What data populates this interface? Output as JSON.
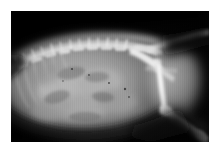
{
  "page": {
    "background_color": "#ffffff",
    "width": 219,
    "height": 155
  },
  "radiograph": {
    "modality": "x-ray",
    "view": "lateral",
    "subject": "small animal abdomen and pelvis",
    "frame": {
      "x": 11,
      "y": 11,
      "width": 198,
      "height": 131,
      "background_color": "#050505"
    },
    "tones": {
      "film_black": "#050505",
      "soft_tissue_dark": "#3a3a3a",
      "soft_tissue_mid": "#7d7d7d",
      "soft_tissue_light": "#a5a5a5",
      "bone_gray": "#c8c8c8",
      "bone_bright": "#eaeaea",
      "cortical_white": "#f6f6f6"
    },
    "anatomy": [
      {
        "name": "dorsal-background-air",
        "label": "Air / film background (dorsal)"
      },
      {
        "name": "lumbar-spine",
        "label": "Lumbar vertebral column"
      },
      {
        "name": "spinous-processes",
        "label": "Dorsal spinous processes"
      },
      {
        "name": "caudal-ribs",
        "label": "Caudal rib arcs"
      },
      {
        "name": "abdominal-cavity",
        "label": "Abdominal soft tissue"
      },
      {
        "name": "bowel-loops",
        "label": "Gas-filled bowel loops"
      },
      {
        "name": "kidney-shadow",
        "label": "Renal silhouette"
      },
      {
        "name": "ventral-abdominal-wall",
        "label": "Ventral abdominal wall"
      },
      {
        "name": "pelvis",
        "label": "Pelvis / ilium"
      },
      {
        "name": "sacrum",
        "label": "Sacrum"
      },
      {
        "name": "tail",
        "label": "Caudal vertebrae (tail)"
      },
      {
        "name": "femur",
        "label": "Femur"
      },
      {
        "name": "stifle-joint",
        "label": "Stifle (knee) joint"
      },
      {
        "name": "tibia-fibula",
        "label": "Tibia and fibula"
      },
      {
        "name": "hock-joint",
        "label": "Tarsus (hock)"
      },
      {
        "name": "thigh-soft-tissue",
        "label": "Thigh musculature"
      }
    ]
  }
}
